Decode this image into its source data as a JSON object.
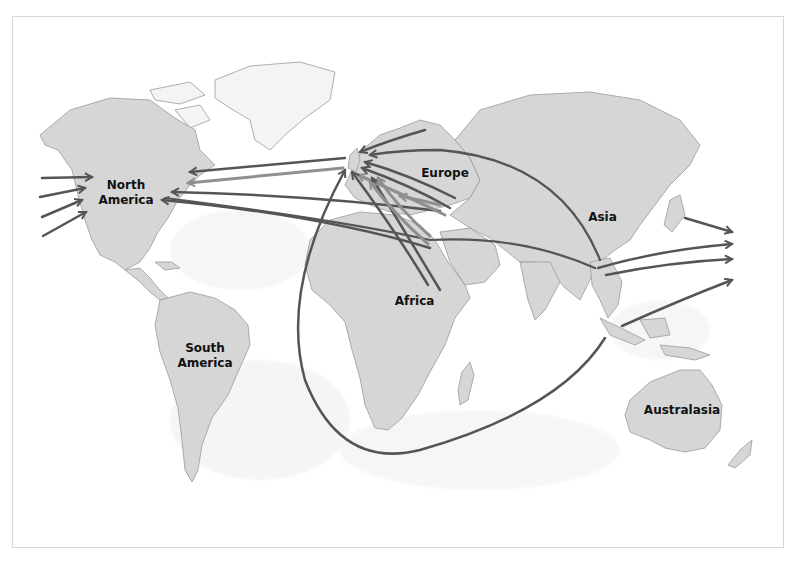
{
  "map": {
    "title": "",
    "style": "grayscale world map with migration arrows",
    "colors": {
      "land": "#d6d6d6",
      "land_dark": "#c2c2c2",
      "coast": "#9a9a9a",
      "arrow_dark": "#555555",
      "arrow_light": "#8f8f8f",
      "label": "#111111"
    },
    "regions": [
      {
        "id": "north-america",
        "lines": [
          "North",
          "America"
        ]
      },
      {
        "id": "south-america",
        "lines": [
          "South",
          "America"
        ]
      },
      {
        "id": "europe",
        "lines": [
          "Europe"
        ]
      },
      {
        "id": "africa",
        "lines": [
          "Africa"
        ]
      },
      {
        "id": "asia",
        "lines": [
          "Asia"
        ]
      },
      {
        "id": "australasia",
        "lines": [
          "Australasia"
        ]
      }
    ]
  }
}
